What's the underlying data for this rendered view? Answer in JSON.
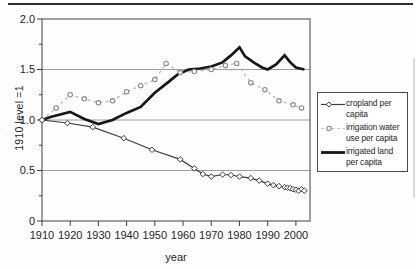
{
  "chart_data": {
    "type": "line",
    "title": "",
    "xlabel": "year",
    "ylabel": "1910 level =1",
    "x_range": [
      1910,
      2005
    ],
    "y_range": [
      0,
      2
    ],
    "x_ticks": [
      1910,
      1920,
      1930,
      1940,
      1950,
      1960,
      1970,
      1980,
      1990,
      2000
    ],
    "y_ticks": [
      {
        "v": 0,
        "label": "0"
      },
      {
        "v": 0.5,
        "label": "0.5"
      },
      {
        "v": 1.0,
        "label": "1.0"
      },
      {
        "v": 1.5,
        "label": "1.5"
      },
      {
        "v": 2.0,
        "label": "2.0"
      }
    ],
    "y_minor_ticks": [
      0.25,
      0.75,
      1.25,
      1.75
    ],
    "grid_values": [
      0.5,
      1.0,
      1.5
    ],
    "grid": true,
    "legend_position": "right-outside",
    "colors": {
      "cropland": "#3d3d3d",
      "irrigation_water_line": "#b9b9b9",
      "irrigation_water_marker": "#878787",
      "irrigated_land": "#161616",
      "gridline": "#9e9e9e",
      "plot_border": "#3f3f3f",
      "text": "#1e1e1e"
    },
    "series": [
      {
        "name": "cropland per capita",
        "name_lines": [
          "cropland per",
          "capita"
        ],
        "style": "solid-diamond",
        "color": "#3d3d3d",
        "points": [
          [
            1910,
            1.0
          ],
          [
            1919,
            0.97
          ],
          [
            1928,
            0.93
          ],
          [
            1939,
            0.82
          ],
          [
            1949,
            0.705
          ],
          [
            1959,
            0.61
          ],
          [
            1964,
            0.52
          ],
          [
            1967,
            0.465
          ],
          [
            1970,
            0.44
          ],
          [
            1974,
            0.46
          ],
          [
            1977,
            0.455
          ],
          [
            1980,
            0.44
          ],
          [
            1984,
            0.425
          ],
          [
            1987,
            0.4
          ],
          [
            1990,
            0.37
          ],
          [
            1992,
            0.355
          ],
          [
            1994,
            0.345
          ],
          [
            1996,
            0.335
          ],
          [
            1997,
            0.33
          ],
          [
            1998,
            0.325
          ],
          [
            1999,
            0.315
          ],
          [
            2000,
            0.31
          ],
          [
            2001,
            0.3
          ],
          [
            2002,
            0.315
          ],
          [
            2003,
            0.3
          ]
        ]
      },
      {
        "name": "irrigation water use per capita",
        "name_lines": [
          "irrigation water",
          "use per capita"
        ],
        "style": "dashed-circle",
        "color": "#b9b9b9",
        "marker_color": "#878787",
        "points": [
          [
            1910,
            1.0
          ],
          [
            1915,
            1.12
          ],
          [
            1920,
            1.25
          ],
          [
            1925,
            1.21
          ],
          [
            1930,
            1.17
          ],
          [
            1935,
            1.19
          ],
          [
            1940,
            1.28
          ],
          [
            1945,
            1.34
          ],
          [
            1950,
            1.4
          ],
          [
            1954,
            1.56
          ],
          [
            1959,
            1.47
          ],
          [
            1964,
            1.48
          ],
          [
            1970,
            1.5
          ],
          [
            1975,
            1.54
          ],
          [
            1979,
            1.56
          ],
          [
            1984,
            1.37
          ],
          [
            1989,
            1.3
          ],
          [
            1994,
            1.19
          ],
          [
            1999,
            1.15
          ],
          [
            2002,
            1.12
          ]
        ]
      },
      {
        "name": "irrigated land per capita",
        "name_lines": [
          "irrigated land",
          "per capita"
        ],
        "style": "thick-solid",
        "color": "#161616",
        "points": [
          [
            1910,
            1.0
          ],
          [
            1913,
            1.03
          ],
          [
            1920,
            1.08
          ],
          [
            1925,
            1.01
          ],
          [
            1930,
            0.96
          ],
          [
            1935,
            1.0
          ],
          [
            1940,
            1.07
          ],
          [
            1945,
            1.13
          ],
          [
            1950,
            1.27
          ],
          [
            1955,
            1.38
          ],
          [
            1958,
            1.45
          ],
          [
            1962,
            1.5
          ],
          [
            1966,
            1.51
          ],
          [
            1970,
            1.53
          ],
          [
            1974,
            1.57
          ],
          [
            1977,
            1.64
          ],
          [
            1980,
            1.72
          ],
          [
            1982,
            1.63
          ],
          [
            1985,
            1.57
          ],
          [
            1988,
            1.52
          ],
          [
            1990,
            1.5
          ],
          [
            1993,
            1.55
          ],
          [
            1996,
            1.64
          ],
          [
            1998,
            1.57
          ],
          [
            2000,
            1.52
          ],
          [
            2003,
            1.5
          ]
        ]
      }
    ]
  }
}
